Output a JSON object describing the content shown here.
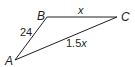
{
  "diagram": {
    "type": "triangle",
    "stroke_color": "#231f20",
    "vertices": [
      {
        "id": "A",
        "label": "A"
      },
      {
        "id": "B",
        "label": "B"
      },
      {
        "id": "C",
        "label": "C"
      }
    ],
    "sides": {
      "AB": {
        "label": "24"
      },
      "BC": {
        "label": "x"
      },
      "AC": {
        "label_num": "1.5",
        "label_var": "x"
      }
    }
  }
}
